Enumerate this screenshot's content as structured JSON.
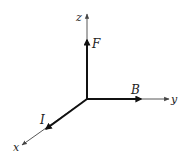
{
  "diagram": {
    "type": "3d-coordinate-axes",
    "colors": {
      "axis": "#444444",
      "vector": "#111111",
      "label": "#222222",
      "background": "#ffffff"
    },
    "axes": {
      "x": {
        "label": "x"
      },
      "y": {
        "label": "y"
      },
      "z": {
        "label": "z"
      }
    },
    "vectors": [
      {
        "label": "I",
        "along": "x"
      },
      {
        "label": "B",
        "along": "y"
      },
      {
        "label": "F",
        "along": "z"
      }
    ]
  }
}
